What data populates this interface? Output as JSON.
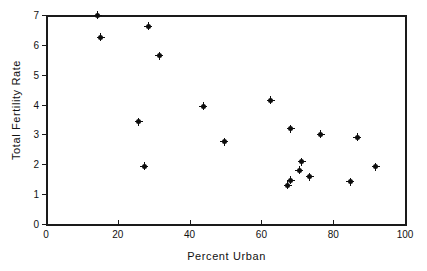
{
  "chart_data": {
    "type": "scatter",
    "title": "",
    "xlabel": "Percent Urban",
    "ylabel": "Total Fertility Rate",
    "xlim": [
      0,
      100
    ],
    "ylim": [
      0,
      7
    ],
    "xticks": [
      0,
      20,
      40,
      60,
      80,
      100
    ],
    "yticks": [
      0,
      1,
      2,
      3,
      4,
      5,
      6,
      7
    ],
    "grid": false,
    "legend": null,
    "marker": "filled-diamond-dot",
    "marker_color": "#0d0d0d",
    "points": [
      {
        "x": 14.4,
        "y": 7.0
      },
      {
        "x": 15.2,
        "y": 6.26
      },
      {
        "x": 25.8,
        "y": 3.43
      },
      {
        "x": 27.4,
        "y": 1.93
      },
      {
        "x": 28.5,
        "y": 6.63
      },
      {
        "x": 31.6,
        "y": 5.63
      },
      {
        "x": 43.8,
        "y": 3.94
      },
      {
        "x": 49.6,
        "y": 2.76
      },
      {
        "x": 62.6,
        "y": 4.15
      },
      {
        "x": 67.3,
        "y": 1.29
      },
      {
        "x": 68.2,
        "y": 3.19
      },
      {
        "x": 68.2,
        "y": 1.47
      },
      {
        "x": 70.6,
        "y": 1.8
      },
      {
        "x": 71.2,
        "y": 2.08
      },
      {
        "x": 73.4,
        "y": 1.59
      },
      {
        "x": 76.5,
        "y": 3.0
      },
      {
        "x": 84.8,
        "y": 1.42
      },
      {
        "x": 86.7,
        "y": 2.91
      },
      {
        "x": 91.9,
        "y": 1.92
      }
    ]
  }
}
